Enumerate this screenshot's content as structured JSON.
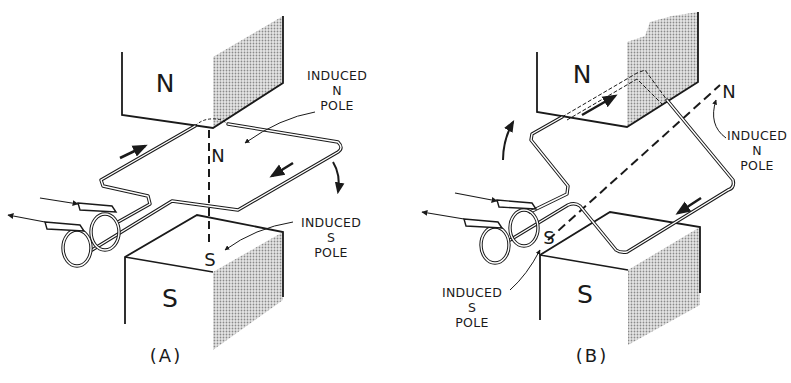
{
  "figure": {
    "panels": [
      {
        "id": "A",
        "caption": "(A)",
        "magnet_top_label": "N",
        "magnet_bottom_label": "S",
        "induced_top_pole": "N",
        "induced_bottom_pole": "S",
        "callout_top": {
          "line1": "INDUCED",
          "line2": "N",
          "line3": "POLE"
        },
        "callout_bottom": {
          "line1": "INDUCED",
          "line2": "S",
          "line3": "POLE"
        }
      },
      {
        "id": "B",
        "caption": "(B)",
        "magnet_top_label": "N",
        "magnet_bottom_label": "S",
        "induced_top_pole": "N",
        "induced_bottom_pole": "S",
        "callout_top": {
          "line1": "INDUCED",
          "line2": "N",
          "line3": "POLE"
        },
        "callout_bottom": {
          "line1": "INDUCED",
          "line2": "S",
          "line3": "POLE"
        }
      }
    ],
    "colors": {
      "ink": "#1a1a1a",
      "shade": "#b8b8b8",
      "background": "#ffffff"
    }
  }
}
